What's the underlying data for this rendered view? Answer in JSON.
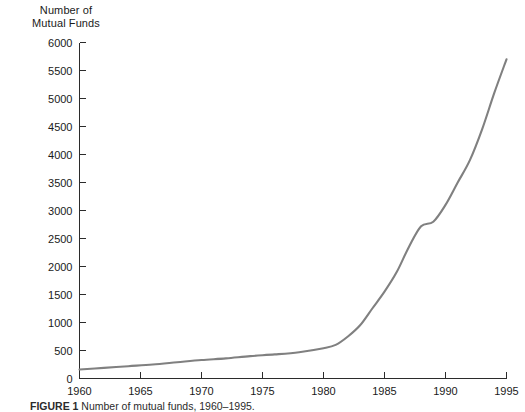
{
  "figure": {
    "caption_label": "FIGURE 1",
    "caption_text": "Number of mutual funds, 1960–1995."
  },
  "axis_title": {
    "line1": "Number of",
    "line2": "Mutual Funds"
  },
  "style": {
    "line_color": "#808080",
    "axis_color": "#2b2b2b",
    "background": "#ffffff"
  },
  "chart_data": {
    "type": "line",
    "title": "",
    "subtitle": "",
    "xlabel": "",
    "ylabel": "Number of Mutual Funds",
    "xlim": [
      1960,
      1995
    ],
    "ylim": [
      0,
      6000
    ],
    "grid": false,
    "legend": "none",
    "x_ticks": [
      1960,
      1965,
      1970,
      1975,
      1980,
      1985,
      1990,
      1995
    ],
    "x_tick_labels": [
      "1960",
      "1965",
      "1970",
      "1975",
      "1980",
      "1985",
      "1990",
      "1995"
    ],
    "y_ticks": [
      0,
      500,
      1000,
      1500,
      2000,
      2500,
      3000,
      3500,
      4000,
      4500,
      5000,
      5500,
      6000
    ],
    "y_tick_labels": [
      "0",
      "500",
      "1000",
      "1500",
      "2000",
      "2500",
      "3000",
      "3500",
      "4000",
      "4500",
      "5000",
      "5500",
      "6000"
    ],
    "series": [
      {
        "name": "Number of Mutual Funds",
        "color": "#808080",
        "x": [
          1960,
          1962,
          1964,
          1966,
          1968,
          1970,
          1972,
          1974,
          1976,
          1978,
          1980,
          1981,
          1982,
          1983,
          1984,
          1985,
          1986,
          1987,
          1988,
          1989,
          1990,
          1991,
          1992,
          1993,
          1994,
          1995
        ],
        "values": [
          160,
          190,
          220,
          250,
          290,
          330,
          360,
          400,
          430,
          470,
          540,
          600,
          750,
          950,
          1250,
          1550,
          1900,
          2350,
          2720,
          2800,
          3100,
          3500,
          3900,
          4450,
          5100,
          5700
        ]
      }
    ]
  }
}
